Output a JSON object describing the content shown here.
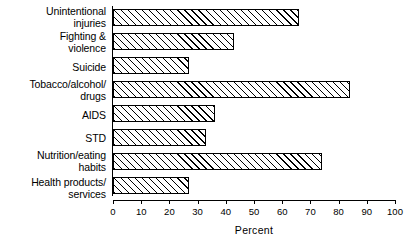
{
  "chart_data": {
    "type": "bar",
    "orientation": "horizontal",
    "title": "",
    "subtitle": "",
    "xlabel": "Percent",
    "ylabel": "",
    "xlim": [
      0,
      100
    ],
    "xticks": [
      0,
      10,
      20,
      30,
      40,
      50,
      60,
      70,
      80,
      90,
      100
    ],
    "xticklabels": [
      "0",
      "10",
      "20",
      "30",
      "40",
      "50",
      "60",
      "70",
      "80",
      "90",
      "100"
    ],
    "grid": false,
    "legend": null,
    "bar_style": {
      "fill": "#ffffff",
      "edge": "#000000",
      "hatch": "diagonal-45"
    },
    "categories": [
      "Unintentional\ninjuries",
      "Fighting &\nviolence",
      "Suicide",
      "Tobacco/alcohol/\ndrugs",
      "AIDS",
      "STD",
      "Nutrition/eating\nhabits",
      "Health products/\nservices"
    ],
    "values": [
      66,
      43,
      27,
      84,
      36,
      33,
      74,
      27
    ],
    "series": [
      {
        "name": "Percent",
        "values": [
          66,
          43,
          27,
          84,
          36,
          33,
          74,
          27
        ]
      }
    ]
  }
}
